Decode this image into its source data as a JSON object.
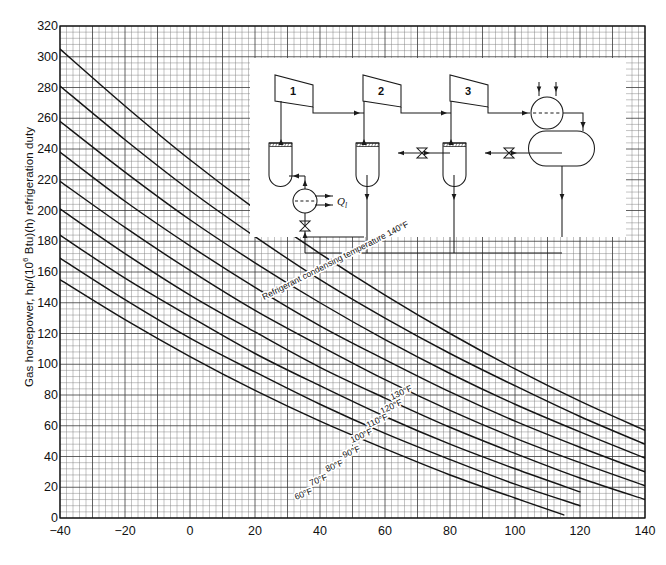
{
  "figure": {
    "title": "",
    "caption": ""
  },
  "axes": {
    "ylabel_text": "Gas horsepower, hp/(10",
    "ylabel_exp": "6",
    "ylabel_text2": " Btu)(h) refrigeration duty",
    "xlabel": "",
    "y_ticks": [
      0,
      20,
      40,
      60,
      80,
      100,
      120,
      140,
      160,
      180,
      200,
      220,
      240,
      260,
      280,
      300,
      320
    ],
    "x_ticks": [
      -40,
      -20,
      0,
      20,
      40,
      60,
      80,
      100,
      120,
      140
    ],
    "xlim": [
      -40,
      140
    ],
    "ylim": [
      0,
      320
    ]
  },
  "chart_data": {
    "type": "line",
    "xlabel": "Refrigerant evaporating temperature, °F",
    "ylabel": "Gas horsepower, hp/(10^6 Btu)(h) refrigeration duty",
    "xlim": [
      -40,
      140
    ],
    "ylim": [
      0,
      320
    ],
    "x_ticks": [
      -40,
      -20,
      0,
      20,
      40,
      60,
      80,
      100,
      120,
      140
    ],
    "y_ticks": [
      0,
      20,
      40,
      60,
      80,
      100,
      120,
      140,
      160,
      180,
      200,
      220,
      240,
      260,
      280,
      300,
      320
    ],
    "grid": "fine graph paper, minor every 2 units x / 4 units y, major every 5 minor",
    "legend": "inline curve labels",
    "legend_position": "on-curve",
    "annotation": "Refrigerant condensing temperature 140°F",
    "series": [
      {
        "name": "140°F",
        "label": "Refrigerant condensing temperature 140°F",
        "x": [
          -40,
          -20,
          0,
          20,
          40,
          60,
          80,
          100,
          120,
          140
        ],
        "y": [
          305,
          268,
          233,
          201,
          172,
          145,
          120,
          97,
          76,
          57
        ]
      },
      {
        "name": "130°F",
        "label": "130°F",
        "x": [
          -40,
          -20,
          0,
          20,
          40,
          60,
          80,
          100,
          120,
          140
        ],
        "y": [
          281,
          246,
          213,
          183,
          155,
          130,
          107,
          86,
          66,
          48
        ]
      },
      {
        "name": "120°F",
        "label": "120°F",
        "x": [
          -40,
          -20,
          0,
          20,
          40,
          60,
          80,
          100,
          120,
          140
        ],
        "y": [
          258,
          225,
          194,
          166,
          140,
          116,
          94,
          74,
          56,
          39
        ]
      },
      {
        "name": "110°F",
        "label": "110°F",
        "x": [
          -40,
          -20,
          0,
          20,
          40,
          60,
          80,
          100,
          120,
          140
        ],
        "y": [
          238,
          206,
          177,
          150,
          125,
          103,
          82,
          63,
          46,
          30
        ]
      },
      {
        "name": "100°F",
        "label": "100°F",
        "x": [
          -40,
          -20,
          0,
          20,
          40,
          60,
          80,
          100,
          120,
          140
        ],
        "y": [
          219,
          189,
          161,
          135,
          112,
          90,
          70,
          52,
          36,
          21
        ]
      },
      {
        "name": "90°F",
        "label": "90°F",
        "x": [
          -40,
          -20,
          0,
          20,
          40,
          60,
          80,
          100,
          120,
          140
        ],
        "y": [
          201,
          172,
          145,
          121,
          98,
          78,
          59,
          42,
          26,
          12
        ]
      },
      {
        "name": "80°F",
        "label": "80°F",
        "x": [
          -40,
          -20,
          0,
          20,
          40,
          60,
          80,
          100,
          120
        ],
        "y": [
          184,
          156,
          131,
          107,
          86,
          66,
          48,
          32,
          17
        ]
      },
      {
        "name": "70°F",
        "label": "70°F",
        "x": [
          -40,
          -20,
          0,
          20,
          40,
          60,
          80,
          100,
          120
        ],
        "y": [
          169,
          142,
          117,
          95,
          74,
          55,
          38,
          22,
          8
        ]
      },
      {
        "name": "60°F",
        "label": "60°F",
        "x": [
          -40,
          -20,
          0,
          20,
          40,
          60,
          80,
          100,
          115
        ],
        "y": [
          155,
          129,
          105,
          83,
          63,
          45,
          28,
          13,
          2
        ]
      }
    ]
  },
  "curve_labels": [
    {
      "text": "Refrigerant condensing temperature 140°F",
      "x": 264,
      "y": 300,
      "angle": -27,
      "size": 8.6
    },
    {
      "text": "130°F",
      "x": 392,
      "y": 400,
      "angle": -25,
      "size": 8.6
    },
    {
      "text": "120°F",
      "x": 382,
      "y": 414,
      "angle": -25,
      "size": 8.6
    },
    {
      "text": "110°F",
      "x": 368,
      "y": 428,
      "angle": -24,
      "size": 8.6
    },
    {
      "text": "100°F",
      "x": 352,
      "y": 443,
      "angle": -24,
      "size": 8.6
    },
    {
      "text": "90°F",
      "x": 344,
      "y": 458,
      "angle": -23,
      "size": 8.6
    },
    {
      "text": "80°F",
      "x": 327,
      "y": 472,
      "angle": -23,
      "size": 8.6
    },
    {
      "text": "70°F",
      "x": 311,
      "y": 486,
      "angle": -22,
      "size": 8.6
    },
    {
      "text": "60°F",
      "x": 296,
      "y": 500,
      "angle": -22,
      "size": 8.6
    }
  ],
  "inset": {
    "name": "three-stage refrigeration process flow diagram",
    "compressors": [
      "1",
      "2",
      "3"
    ],
    "heat_label": "Q",
    "heat_label_sub": "l",
    "components": [
      "compressor-1",
      "compressor-2",
      "compressor-3",
      "flash-drum-1",
      "flash-drum-2",
      "flash-drum-3",
      "condenser",
      "receiver",
      "expansion-valve-1",
      "expansion-valve-2",
      "expansion-valve-3",
      "chiller"
    ]
  }
}
